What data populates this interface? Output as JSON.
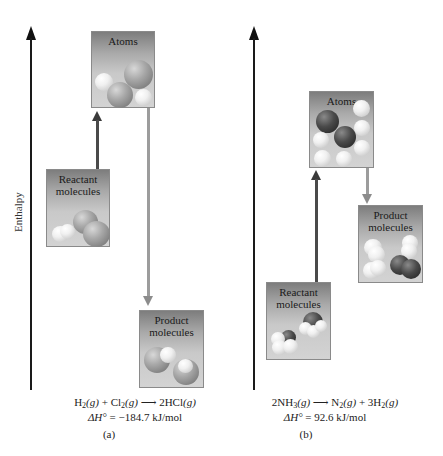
{
  "y_axis_label": "Enthalpy",
  "colors": {
    "axis": "#1a1a1a",
    "up_arrow": "#4a4a4a",
    "down_arrow": "#9c9c9c",
    "box_top": "#7d7d7d",
    "box_bottom": "#d3d3d3",
    "chlorine_atom": "#8e8e8e",
    "hydrogen_atom": "#f0f0f0",
    "nitrogen_atom": "#3a3a3a"
  },
  "panels": [
    {
      "id": "a",
      "caption": "(a)",
      "boxes": {
        "atoms": "Atoms",
        "reactant_line1": "Reactant",
        "reactant_line2": "molecules",
        "product_line1": "Product",
        "product_line2": "molecules"
      },
      "equation": {
        "reactant1": "H",
        "reactant1_sub": "2",
        "reactant1_state": "(g)",
        "plus": " + ",
        "reactant2": "Cl",
        "reactant2_sub": "2",
        "reactant2_state": "(g)",
        "arrow": " ⟶ ",
        "product1": "2HCl",
        "product1_state": "(g)"
      },
      "delta_h": {
        "symbol": "ΔH°",
        "equals": " = ",
        "value": "−184.7 kJ/mol"
      }
    },
    {
      "id": "b",
      "caption": "(b)",
      "boxes": {
        "atoms": "Atoms",
        "reactant_line1": "Reactant",
        "reactant_line2": "molecules",
        "product_line1": "Product",
        "product_line2": "molecules"
      },
      "equation": {
        "reactant1": "2NH",
        "reactant1_sub": "3",
        "reactant1_state": "(g)",
        "arrow": " ⟶ ",
        "product1": "N",
        "product1_sub": "2",
        "product1_state": "(g)",
        "plus": " +  ",
        "product2": "3H",
        "product2_sub": "2",
        "product2_state": "(g)"
      },
      "delta_h": {
        "symbol": "ΔH°",
        "equals": " = ",
        "value": "92.6 kJ/mol"
      }
    }
  ]
}
